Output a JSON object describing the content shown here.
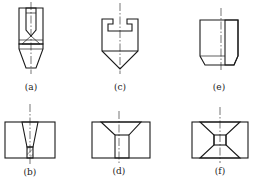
{
  "figure": {
    "colors": {
      "line": "#1a1a1a",
      "background": "#ffffff"
    },
    "panels": [
      {
        "id": "a",
        "label": "(a)",
        "description": "nozzle insert with hatched body, inner bore and tapered conical tip"
      },
      {
        "id": "c",
        "label": "(c)",
        "description": "cup-shaped body with T-slot on top and pointed conical bottom"
      },
      {
        "id": "e",
        "label": "(e)",
        "description": "half-section of cylinder with chamfered bottom, right half hatched"
      },
      {
        "id": "b",
        "label": "(b)",
        "description": "block with tapered through-hole narrowing to small bottom orifice"
      },
      {
        "id": "d",
        "label": "(d)",
        "description": "block with top countersink and straight cylindrical hole"
      },
      {
        "id": "f",
        "label": "(f)",
        "description": "block with double countersink meeting at small central square passage"
      }
    ]
  }
}
